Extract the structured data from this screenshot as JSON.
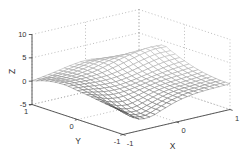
{
  "figure": {
    "background": "#ffffff",
    "width": 251,
    "height": 153
  },
  "chart_data": {
    "type": "surface",
    "plot_style": "wireframe-mesh",
    "title": "",
    "xlabel": "X",
    "ylabel": "Y",
    "zlabel": "Z",
    "xlim": [
      -1,
      1
    ],
    "ylim": [
      -1,
      1
    ],
    "zlim": [
      -5,
      10
    ],
    "xticks": [
      -1,
      0,
      1
    ],
    "yticks": [
      -1,
      0,
      1
    ],
    "zticks": [
      -5,
      0,
      5,
      10
    ],
    "grid": true,
    "grid_line_style": "dotted",
    "view": {
      "azimuth": -37.5,
      "elevation": 30
    },
    "surface": {
      "x": [
        -1,
        -0.75,
        -0.5,
        -0.25,
        0,
        0.25,
        0.5,
        0.75,
        1
      ],
      "y": [
        -1,
        -0.75,
        -0.5,
        -0.25,
        0,
        0.25,
        0.5,
        0.75,
        1
      ],
      "z": [
        [
          0.0,
          -2.3,
          -2.6,
          -1.6,
          -0.6,
          0.0,
          0.3,
          0.4,
          0.5
        ],
        [
          0.2,
          -1.9,
          -2.4,
          -1.5,
          -0.5,
          0.1,
          0.3,
          0.5,
          0.6
        ],
        [
          0.5,
          -1.0,
          -1.6,
          -1.0,
          -0.2,
          0.3,
          0.5,
          0.7,
          0.9
        ],
        [
          0.9,
          0.0,
          -0.5,
          -0.3,
          0.2,
          0.7,
          1.0,
          1.2,
          1.4
        ],
        [
          1.2,
          0.8,
          0.4,
          0.3,
          0.6,
          1.1,
          1.6,
          2.0,
          2.2
        ],
        [
          1.5,
          1.3,
          1.1,
          1.1,
          1.4,
          2.0,
          2.7,
          3.2,
          3.2
        ],
        [
          1.4,
          1.3,
          1.4,
          1.7,
          2.4,
          3.1,
          3.7,
          4.1,
          4.0
        ],
        [
          0.9,
          1.0,
          1.3,
          1.8,
          2.4,
          2.6,
          2.4,
          1.8,
          1.2
        ],
        [
          0.1,
          0.5,
          1.0,
          1.5,
          1.8,
          1.5,
          0.8,
          0.0,
          -0.9
        ]
      ]
    },
    "mesh_resolution": 21,
    "colors": {
      "background": "#ffffff",
      "grid": "#a6a6a6",
      "axis": "#4a4a4a",
      "label": "#333333",
      "mesh_face": "#ffffff",
      "mesh_dark": "#464646",
      "mesh_light": "#b9b9b9"
    }
  }
}
